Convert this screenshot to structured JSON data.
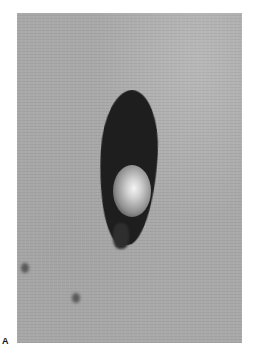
{
  "figure": {
    "panel_label": "A",
    "colors": {
      "skin": "#a9a9a9",
      "lesion": "#1e1e1e",
      "highlight": "#f4f4f4"
    }
  }
}
